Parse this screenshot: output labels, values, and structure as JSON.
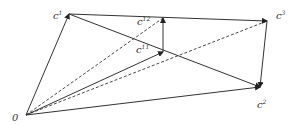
{
  "diagram": {
    "colors": {
      "line": "#333333",
      "background": "#ffffff"
    },
    "points": {
      "O": {
        "label": "0",
        "x": 26,
        "y": 115
      },
      "c1": {
        "label": "c",
        "sup": "1",
        "x": 69,
        "y": 14
      },
      "c12": {
        "label": "c",
        "sup": "12",
        "x": 163,
        "y": 18
      },
      "c11": {
        "label": "c",
        "sup": "11",
        "x": 163,
        "y": 52
      },
      "c3": {
        "label": "c",
        "sup": "3",
        "x": 267,
        "y": 21
      },
      "c2": {
        "label": "c",
        "sup": "2",
        "x": 260,
        "y": 87
      }
    },
    "edges": [
      {
        "from": "O",
        "to": "c1",
        "style": "solid",
        "arrow": true
      },
      {
        "from": "O",
        "to": "c12",
        "style": "dashed",
        "arrow": false
      },
      {
        "from": "O",
        "to": "c11",
        "style": "solid",
        "arrow": true
      },
      {
        "from": "O",
        "to": "c3",
        "style": "dashed",
        "arrow": false
      },
      {
        "from": "O",
        "to": "c2",
        "style": "solid",
        "arrow": true
      },
      {
        "from": "c1",
        "to": "c3",
        "style": "solid",
        "arrow": true
      },
      {
        "from": "c1",
        "to": "c2",
        "style": "solid",
        "arrow": true
      },
      {
        "from": "c11",
        "to": "c12",
        "style": "solid",
        "arrow": true
      },
      {
        "from": "c3",
        "to": "c2",
        "style": "solid",
        "arrow": true
      }
    ]
  }
}
